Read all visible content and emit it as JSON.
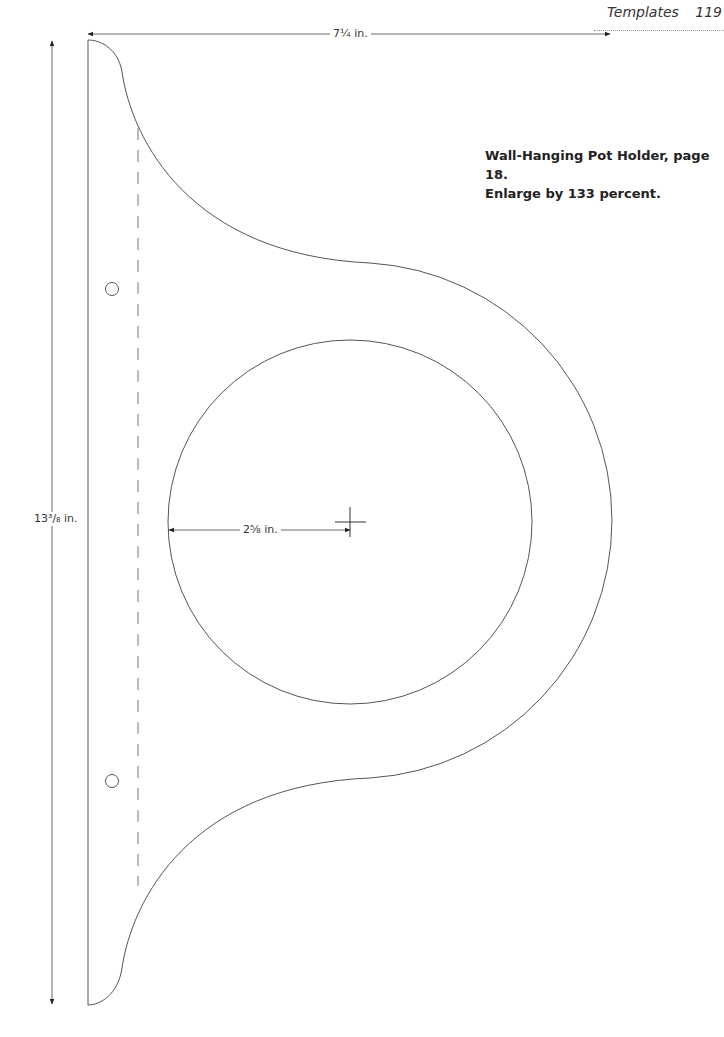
{
  "header": {
    "section_title": "Templates",
    "page_number": "119"
  },
  "caption": {
    "line1": "Wall-Hanging Pot Holder, page 18.",
    "line2": "Enlarge by 133 percent."
  },
  "dimensions": {
    "width_label": "7¼ in.",
    "height_label": "13³/₈ in.",
    "radius_label": "2⅝ in."
  },
  "colors": {
    "line": "#555555",
    "text": "#231f20"
  }
}
